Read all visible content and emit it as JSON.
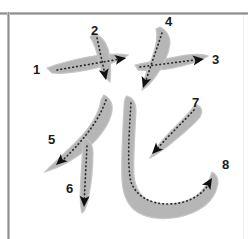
{
  "diagram": {
    "character": "花",
    "stroke_count": 8,
    "colors": {
      "stroke_fill": "#b6b6b6",
      "stroke_fill_light": "#c6c6c6",
      "path_dots": "#2b2b2b",
      "arrow": "#111111",
      "label_text": "#1a1a1a",
      "background": "#ffffff",
      "frame_line": "#8e8e8e"
    },
    "labels": [
      {
        "id": 1,
        "text": "1",
        "x": 33,
        "y": 63
      },
      {
        "id": 2,
        "text": "2",
        "x": 91,
        "y": 24
      },
      {
        "id": 3,
        "text": "3",
        "x": 212,
        "y": 53
      },
      {
        "id": 4,
        "text": "4",
        "x": 165,
        "y": 15
      },
      {
        "id": 5,
        "text": "5",
        "x": 48,
        "y": 133
      },
      {
        "id": 6,
        "text": "6",
        "x": 66,
        "y": 182
      },
      {
        "id": 7,
        "text": "7",
        "x": 192,
        "y": 96
      },
      {
        "id": 8,
        "text": "8",
        "x": 222,
        "y": 158
      }
    ],
    "strokes": [
      {
        "order": 1,
        "name": "horizontal",
        "body": "M47,68 C60,63 80,58 100,55 C112,54 122,54 128,55 C122,60 110,64 96,68 C80,72 62,74 52,73 Z",
        "guide": "M57,70 L126,58",
        "arrow": {
          "x": 126,
          "y": 58,
          "angle": -10
        }
      },
      {
        "order": 2,
        "name": "vertical-with-hook",
        "body": "M94,33 C101,36 106,42 108,49 C111,60 111,72 110,82 C106,79 102,74 100,66 C98,56 95,44 90,37 Z",
        "guide": "M97,38 L106,79",
        "arrow": {
          "x": 106,
          "y": 80,
          "angle": 78
        }
      },
      {
        "order": 3,
        "name": "horizontal-right",
        "body": "M135,65 C150,62 168,58 186,55 C196,54 204,54 208,56 C203,60 194,63 182,66 C166,70 148,71 138,70 Z",
        "guide": "M140,67 L203,59",
        "arrow": {
          "x": 204,
          "y": 59,
          "angle": -8
        }
      },
      {
        "order": 4,
        "name": "left-falling-diagonal",
        "body": "M160,27 C166,30 170,36 170,43 C169,54 163,66 156,76 C151,83 146,88 142,90 C143,82 147,70 152,58 C156,47 158,35 156,29 Z",
        "guide": "M162,33 L144,86",
        "arrow": {
          "x": 143,
          "y": 88,
          "angle": 108
        }
      },
      {
        "order": 5,
        "name": "long-left-falling",
        "body": "M104,95 C110,98 113,104 112,111 C110,123 101,136 88,148 C74,160 58,168 45,172 C52,164 64,154 76,142 C89,129 99,114 101,100 Z",
        "guide": "M106,100 C100,118 86,138 62,161",
        "arrow": {
          "x": 56,
          "y": 165,
          "angle": 138
        }
      },
      {
        "order": 6,
        "name": "vertical",
        "body": "M87,139 C91,142 93,147 93,153 C93,168 91,186 88,200 C86,208 84,212 82,213 C80,206 80,192 81,176 C82,160 83,146 83,140 Z",
        "guide": "M87,146 L84,205",
        "arrow": {
          "x": 84,
          "y": 207,
          "angle": 93
        }
      },
      {
        "order": 7,
        "name": "left-falling-short",
        "body": "M197,105 C202,107 203,112 200,117 C193,126 180,136 168,146 C160,152 154,156 150,158 C154,150 162,140 172,130 C183,119 192,110 194,106 Z",
        "guide": "M194,110 C185,120 170,134 156,150",
        "arrow": {
          "x": 152,
          "y": 154,
          "angle": 134
        }
      },
      {
        "order": 8,
        "name": "vertical-bend-hook",
        "body": "M127,96 C133,98 136,103 136,110 C135,132 133,158 134,175 C135,189 141,198 153,202 C166,206 184,204 196,196 C204,190 209,182 212,172 C216,174 218,178 218,183 C216,196 207,207 192,213 C175,220 155,220 143,215 C130,210 123,198 122,180 C121,158 123,128 124,108 C124,101 125,97 127,96 Z",
        "guide": "M131,103 C129,135 127,165 131,182 C136,196 150,204 168,204 C186,204 200,197 209,184",
        "arrow": {
          "x": 212,
          "y": 178,
          "angle": -58
        }
      }
    ]
  }
}
